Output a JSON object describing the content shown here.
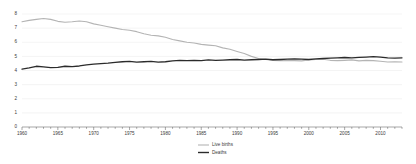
{
  "chart_data": {
    "type": "line",
    "title": "",
    "subtitle": "",
    "xlabel": "",
    "ylabel": "",
    "xlim": [
      1960,
      2013
    ],
    "ylim": [
      0,
      8
    ],
    "grid": true,
    "legend_position": "bottom-center",
    "yticks": [
      0,
      1,
      2,
      3,
      4,
      5,
      6,
      7,
      8
    ],
    "ytick_labels": [
      "0",
      "1",
      "2",
      "3",
      "4",
      "5",
      "6",
      "7",
      "8"
    ],
    "xticks": [
      1960,
      1965,
      1970,
      1975,
      1980,
      1985,
      1990,
      1995,
      2000,
      2005,
      2010
    ],
    "xtick_labels": [
      "1960",
      "1965",
      "1970",
      "1975",
      "1980",
      "1985",
      "1990",
      "1995",
      "2000",
      "2005",
      "2010"
    ],
    "x": [
      1960,
      1961,
      1962,
      1963,
      1964,
      1965,
      1966,
      1967,
      1968,
      1969,
      1970,
      1971,
      1972,
      1973,
      1974,
      1975,
      1976,
      1977,
      1978,
      1979,
      1980,
      1981,
      1982,
      1983,
      1984,
      1985,
      1986,
      1987,
      1988,
      1989,
      1990,
      1991,
      1992,
      1993,
      1994,
      1995,
      1996,
      1997,
      1998,
      1999,
      2000,
      2001,
      2002,
      2003,
      2004,
      2005,
      2006,
      2007,
      2008,
      2009,
      2010,
      2011,
      2012,
      2013
    ],
    "series": [
      {
        "name": "Live births",
        "color": "#b4b4b4",
        "values": [
          7.45,
          7.55,
          7.62,
          7.68,
          7.62,
          7.48,
          7.42,
          7.45,
          7.5,
          7.45,
          7.3,
          7.2,
          7.1,
          7.0,
          6.9,
          6.85,
          6.75,
          6.6,
          6.5,
          6.45,
          6.35,
          6.2,
          6.1,
          6.0,
          5.95,
          5.85,
          5.8,
          5.75,
          5.6,
          5.5,
          5.35,
          5.2,
          5.0,
          4.85,
          4.78,
          4.72,
          4.7,
          4.72,
          4.7,
          4.68,
          4.75,
          4.78,
          4.8,
          4.72,
          4.7,
          4.72,
          4.75,
          4.68,
          4.72,
          4.7,
          4.65,
          4.6,
          4.62,
          4.6
        ]
      },
      {
        "name": "Deaths",
        "color": "#2b2b2b",
        "values": [
          4.1,
          4.18,
          4.3,
          4.25,
          4.2,
          4.22,
          4.3,
          4.28,
          4.32,
          4.4,
          4.45,
          4.48,
          4.52,
          4.58,
          4.62,
          4.65,
          4.6,
          4.62,
          4.64,
          4.6,
          4.62,
          4.68,
          4.72,
          4.7,
          4.72,
          4.7,
          4.75,
          4.72,
          4.74,
          4.76,
          4.78,
          4.74,
          4.76,
          4.78,
          4.8,
          4.76,
          4.78,
          4.8,
          4.82,
          4.8,
          4.78,
          4.82,
          4.85,
          4.88,
          4.9,
          4.92,
          4.9,
          4.93,
          4.95,
          4.98,
          4.95,
          4.9,
          4.88,
          4.9
        ]
      }
    ]
  },
  "legend": {
    "items": [
      {
        "label": "Live births"
      },
      {
        "label": "Deaths"
      }
    ]
  }
}
